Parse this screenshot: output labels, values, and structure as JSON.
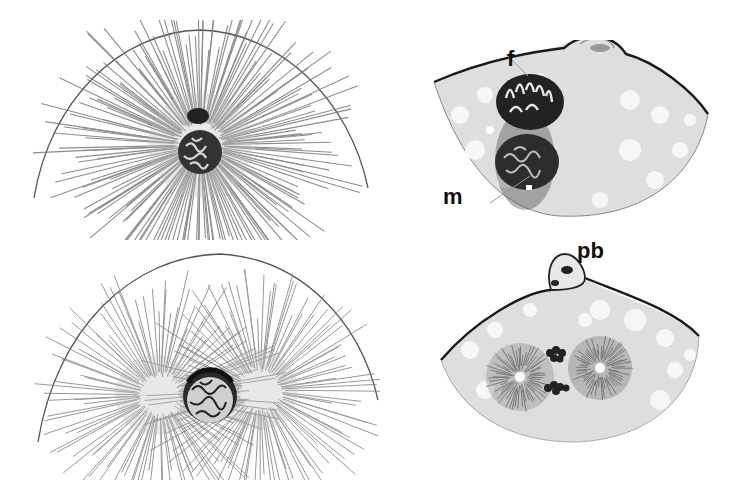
{
  "figure": {
    "type": "biological illustration",
    "panels": [
      {
        "id": "top-left",
        "description": "single pronucleus with radiating aster inside semicircular egg outline"
      },
      {
        "id": "bottom-left",
        "description": "nucleus flanked by two asters (spindle poles) inside semicircular egg outline"
      },
      {
        "id": "top-right",
        "description": "egg cytoplasm section with female and male pronuclei in contact, polar body at surface"
      },
      {
        "id": "bottom-right",
        "description": "egg section with two centrosomes (asters) and condensed chromosomes, polar bodies at surface"
      }
    ],
    "labels": {
      "female_pronucleus": "f",
      "male_pronucleus": "m",
      "polar_body": "pb"
    },
    "colors": {
      "background": "#ffffff",
      "ink": "#1a1a1a",
      "cytoplasm": "#d9d9d9",
      "ray": "#6b6b6b",
      "vacuole": "#f7f7f7"
    }
  }
}
